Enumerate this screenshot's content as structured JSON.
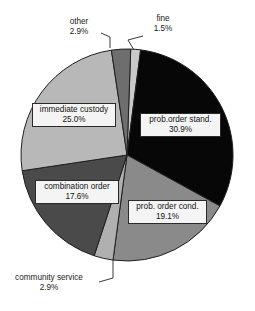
{
  "chart_data": {
    "type": "pie",
    "title": "",
    "subtitle": "",
    "xlabel": "",
    "ylabel": "",
    "legend_position": "none",
    "grid": false,
    "units": "percent",
    "total": 99.9,
    "categories": [
      "fine",
      "prob.order stand.",
      "prob. order cond.",
      "community service",
      "combination order",
      "immediate custody",
      "other"
    ],
    "values": [
      1.5,
      30.9,
      19.1,
      2.9,
      17.6,
      25.0,
      2.9
    ],
    "slices": [
      {
        "label": "fine",
        "value": 1.5,
        "percent_text": "1.5%",
        "color": "#c9c9c9",
        "label_style": "callout",
        "text_color": "#1a1a1a"
      },
      {
        "label": "prob.order stand.",
        "value": 30.9,
        "percent_text": "30.9%",
        "color": "#070707",
        "label_style": "boxed-inside",
        "text_color": "#111111"
      },
      {
        "label": "prob. order cond.",
        "value": 19.1,
        "percent_text": "19.1%",
        "color": "#8a8a8a",
        "label_style": "boxed-inside",
        "text_color": "#111111"
      },
      {
        "label": "community service",
        "value": 2.9,
        "percent_text": "2.9%",
        "color": "#b0b0b0",
        "label_style": "callout",
        "text_color": "#1a1a1a"
      },
      {
        "label": "combination order",
        "value": 17.6,
        "percent_text": "17.6%",
        "color": "#4a4a4a",
        "label_style": "boxed-inside",
        "text_color": "#111111"
      },
      {
        "label": "immediate custody",
        "value": 25.0,
        "percent_text": "25.0%",
        "color": "#b8b8b8",
        "label_style": "boxed-inside",
        "text_color": "#111111"
      },
      {
        "label": "other",
        "value": 2.9,
        "percent_text": "2.9%",
        "color": "#6e6e6e",
        "label_style": "callout",
        "text_color": "#1a1a1a"
      }
    ],
    "geometry": {
      "center_x": 127,
      "center_y": 155,
      "radius": 106,
      "start_angle_deg": -88,
      "direction": "clockwise"
    },
    "style": {
      "background": "#ffffff",
      "outline_color": "#1f1f1f",
      "label_box_fill": "#f4f4f4",
      "label_box_border": "#2a2a2a",
      "leader_line_color": "#3a3a3a"
    }
  }
}
